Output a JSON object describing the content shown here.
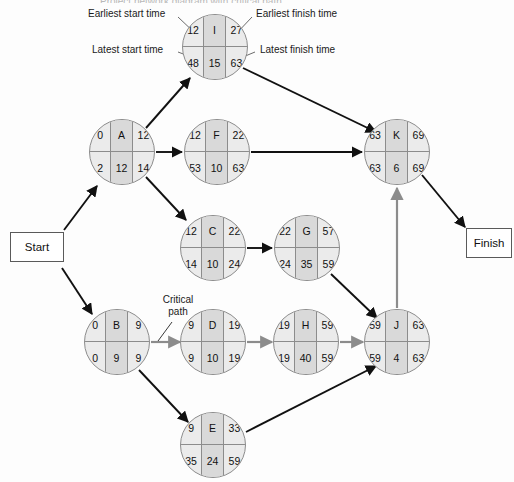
{
  "diagram": {
    "title": "Project network diagram with critical path",
    "legend_labels": [
      {
        "id": "earliest-start",
        "text": "Earliest start time"
      },
      {
        "id": "latest-start",
        "text": "Latest start time"
      },
      {
        "id": "earliest-finish",
        "text": "Earliest finish time"
      },
      {
        "id": "latest-finish",
        "text": "Latest finish time"
      }
    ],
    "critical_path_label": "Critical\npath",
    "critical_path_label_line1": "Critical",
    "critical_path_label_line2": "path",
    "terminals": {
      "start": "Start",
      "finish": "Finish"
    },
    "colors": {
      "node_fill": "#ebebeb",
      "node_center_fill": "#d9d9d9",
      "node_stroke": "#8c8c8c",
      "edge": "#111111",
      "critical_edge": "#8c8c8c",
      "text": "#111111"
    },
    "nodes": [
      {
        "id": "I",
        "activity": "I",
        "es": "12",
        "ef": "27",
        "ls": "48",
        "lf": "63",
        "duration": "15",
        "cx": 215,
        "cy": 47
      },
      {
        "id": "A",
        "activity": "A",
        "es": "0",
        "ef": "12",
        "ls": "2",
        "lf": "14",
        "duration": "12",
        "cx": 122,
        "cy": 152
      },
      {
        "id": "F",
        "activity": "F",
        "es": "12",
        "ef": "22",
        "ls": "53",
        "lf": "63",
        "duration": "10",
        "cx": 217,
        "cy": 152
      },
      {
        "id": "K",
        "activity": "K",
        "es": "63",
        "ef": "69",
        "ls": "63",
        "lf": "69",
        "duration": "6",
        "cx": 397,
        "cy": 152
      },
      {
        "id": "C",
        "activity": "C",
        "es": "12",
        "ef": "22",
        "ls": "14",
        "lf": "24",
        "duration": "10",
        "cx": 213,
        "cy": 248
      },
      {
        "id": "G",
        "activity": "G",
        "es": "22",
        "ef": "57",
        "ls": "24",
        "lf": "59",
        "duration": "35",
        "cx": 307,
        "cy": 248
      },
      {
        "id": "B",
        "activity": "B",
        "es": "0",
        "ef": "9",
        "ls": "0",
        "lf": "9",
        "duration": "9",
        "cx": 117,
        "cy": 342
      },
      {
        "id": "D",
        "activity": "D",
        "es": "9",
        "ef": "19",
        "ls": "9",
        "lf": "19",
        "duration": "10",
        "cx": 213,
        "cy": 342
      },
      {
        "id": "H",
        "activity": "H",
        "es": "19",
        "ef": "59",
        "ls": "19",
        "lf": "59",
        "duration": "40",
        "cx": 306,
        "cy": 342
      },
      {
        "id": "J",
        "activity": "J",
        "es": "59",
        "ef": "63",
        "ls": "59",
        "lf": "63",
        "duration": "4",
        "cx": 397,
        "cy": 342
      },
      {
        "id": "E",
        "activity": "E",
        "es": "9",
        "ef": "33",
        "ls": "35",
        "lf": "59",
        "duration": "24",
        "cx": 213,
        "cy": 445
      }
    ],
    "edges": [
      {
        "from": "Start",
        "to": "A",
        "critical": false
      },
      {
        "from": "Start",
        "to": "B",
        "critical": false
      },
      {
        "from": "A",
        "to": "I",
        "critical": false
      },
      {
        "from": "A",
        "to": "F",
        "critical": false
      },
      {
        "from": "A",
        "to": "C",
        "critical": false
      },
      {
        "from": "I",
        "to": "K",
        "critical": false
      },
      {
        "from": "F",
        "to": "K",
        "critical": false
      },
      {
        "from": "C",
        "to": "G",
        "critical": false
      },
      {
        "from": "G",
        "to": "J",
        "critical": false
      },
      {
        "from": "B",
        "to": "D",
        "critical": true
      },
      {
        "from": "B",
        "to": "E",
        "critical": false
      },
      {
        "from": "D",
        "to": "H",
        "critical": true
      },
      {
        "from": "H",
        "to": "J",
        "critical": true
      },
      {
        "from": "E",
        "to": "J",
        "critical": false
      },
      {
        "from": "J",
        "to": "K",
        "critical": true
      },
      {
        "from": "K",
        "to": "Finish",
        "critical": false
      }
    ]
  }
}
